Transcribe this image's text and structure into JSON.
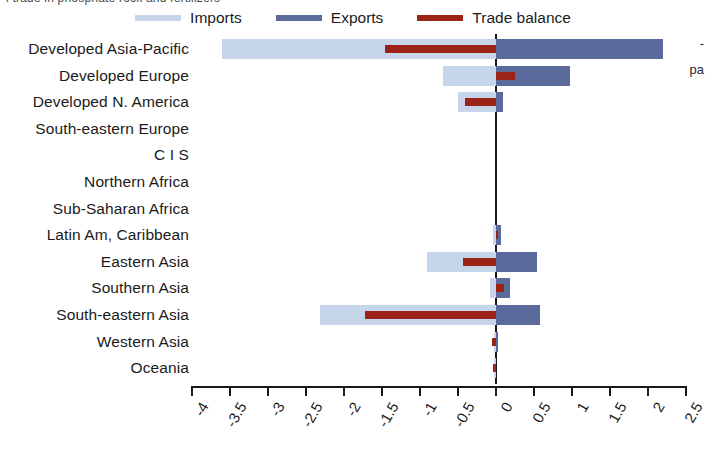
{
  "caption_fragment": "l trade in phosphate rock and fertilizers",
  "side_fragment": "pa",
  "side_tick": "-",
  "legend": {
    "items": [
      {
        "label": "Imports",
        "color": "#c7d5ea",
        "name": "imports"
      },
      {
        "label": "Exports",
        "color": "#5a6a9c",
        "name": "exports"
      },
      {
        "label": "Trade balance",
        "color": "#9b2318",
        "name": "trade-balance"
      }
    ]
  },
  "chart_data": {
    "type": "bar",
    "orientation": "horizontal",
    "title": "",
    "xlabel": "",
    "ylabel": "",
    "xlim": [
      -4,
      2.5
    ],
    "grid": false,
    "legend_position": "top-center",
    "tick_labels": [
      "-4",
      "-3.5",
      "-3",
      "-2.5",
      "-2",
      "-1.5",
      "-1",
      "-0.5",
      "0",
      "0.5",
      "1",
      "1.5",
      "2",
      "2.5"
    ],
    "tick_values": [
      -4,
      -3.5,
      -3,
      -2.5,
      -2,
      -1.5,
      -1,
      -0.5,
      0,
      0.5,
      1,
      1.5,
      2,
      2.5
    ],
    "categories": [
      "Developed Asia-Pacific",
      "Developed Europe",
      "Developed N. America",
      "South-eastern Europe",
      "C I S",
      "Northern Africa",
      "Sub-Saharan Africa",
      "Latin Am, Caribbean",
      "Eastern Asia",
      "Southern Asia",
      "South-eastern Asia",
      "Western Asia",
      "Oceania"
    ],
    "series": [
      {
        "name": "Imports",
        "color": "#c7d5ea",
        "values": [
          -3.6,
          -0.7,
          -0.5,
          0,
          0,
          0,
          0,
          -0.04,
          -0.91,
          -0.08,
          -2.32,
          -0.02,
          -0.02
        ]
      },
      {
        "name": "Exports",
        "color": "#5a6a9c",
        "values": [
          2.2,
          0.97,
          0.09,
          0,
          0,
          0,
          0,
          0.06,
          0.54,
          0.19,
          0.58,
          0.01,
          0.0
        ]
      },
      {
        "name": "Trade balance",
        "color": "#9b2318",
        "values": [
          -1.46,
          0.25,
          -0.41,
          0,
          0,
          0,
          0,
          0.02,
          -0.43,
          0.11,
          -1.72,
          -0.05,
          -0.04
        ]
      }
    ]
  }
}
